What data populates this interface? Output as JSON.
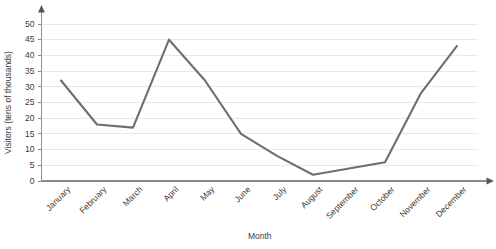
{
  "chart_data": {
    "type": "line",
    "title": "",
    "xlabel": "Month",
    "ylabel": "Visitors (tens of thousands)",
    "categories": [
      "January",
      "February",
      "March",
      "April",
      "May",
      "June",
      "July",
      "August",
      "September",
      "October",
      "November",
      "December"
    ],
    "values": [
      32,
      18,
      17,
      45,
      32,
      15,
      8,
      2,
      4,
      6,
      28,
      43
    ],
    "series": [
      {
        "name": "Visitors",
        "values": [
          32,
          18,
          17,
          45,
          32,
          15,
          8,
          2,
          4,
          6,
          28,
          43
        ]
      }
    ],
    "ylim": [
      0,
      50
    ],
    "yticks": [
      0,
      5,
      10,
      15,
      20,
      25,
      30,
      35,
      40,
      45,
      50
    ],
    "ytick_labels": [
      "0",
      "5",
      "10",
      "15",
      "20",
      "25",
      "30",
      "35",
      "40",
      "45",
      "50"
    ],
    "grid": true,
    "grid_axis": "y",
    "legend": false,
    "legend_position": "none",
    "line_color": "#6e6e6e",
    "grid_color": "#e9e9e9",
    "axis_color": "#8c8c8c",
    "text_color": "#3a3a3a",
    "xtick_label_rotation": -45,
    "x_axis_has_arrow": true,
    "y_axis_has_arrow": true
  }
}
